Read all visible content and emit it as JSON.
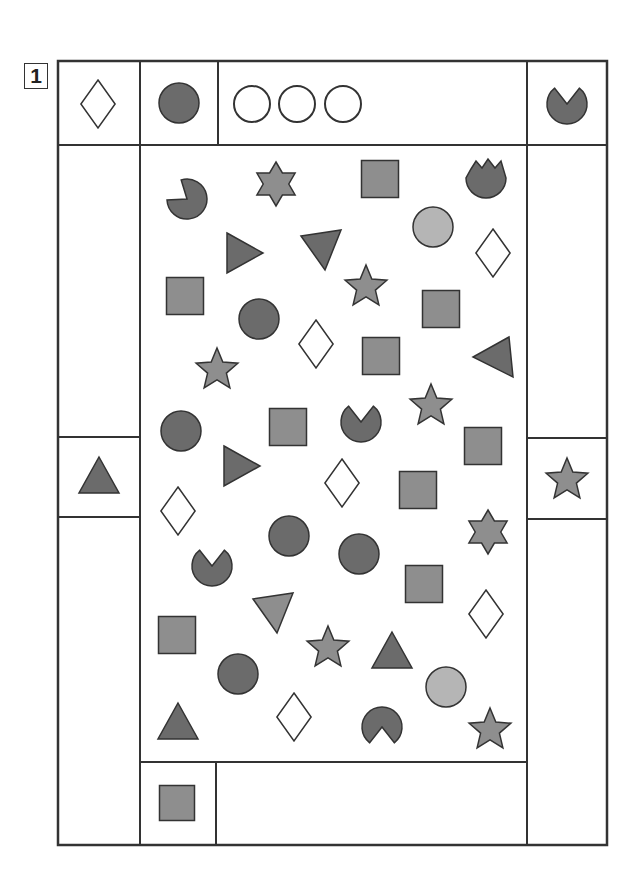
{
  "puzzle": {
    "number": "1",
    "colors": {
      "dark": "#6b6b6b",
      "medium": "#8e8e8e",
      "light": "#b5b5b5",
      "stroke": "#333333",
      "white": "#ffffff"
    },
    "frame": {
      "outer": {
        "x": 58,
        "y": 61,
        "w": 549,
        "h": 784
      },
      "lines": [
        {
          "x1": 58,
          "y1": 145,
          "x2": 607,
          "y2": 145
        },
        {
          "x1": 140,
          "y1": 61,
          "x2": 140,
          "y2": 845
        },
        {
          "x1": 527,
          "y1": 61,
          "x2": 527,
          "y2": 845
        },
        {
          "x1": 218,
          "y1": 61,
          "x2": 218,
          "y2": 145
        },
        {
          "x1": 140,
          "y1": 762,
          "x2": 527,
          "y2": 762
        },
        {
          "x1": 216,
          "y1": 762,
          "x2": 216,
          "y2": 845
        },
        {
          "x1": 58,
          "y1": 437,
          "x2": 140,
          "y2": 437
        },
        {
          "x1": 58,
          "y1": 517,
          "x2": 140,
          "y2": 517
        },
        {
          "x1": 527,
          "y1": 438,
          "x2": 607,
          "y2": 438
        },
        {
          "x1": 527,
          "y1": 519,
          "x2": 607,
          "y2": 519
        }
      ]
    },
    "clue_cells": [
      {
        "id": "top-left",
        "shape": "diamond",
        "fill": "white",
        "x": 98,
        "y": 104,
        "size": 36
      },
      {
        "id": "top-second",
        "shape": "circle",
        "fill": "dark",
        "x": 179,
        "y": 103,
        "size": 40
      },
      {
        "id": "top-wide-1",
        "shape": "circle",
        "fill": "white",
        "x": 252,
        "y": 104,
        "size": 36
      },
      {
        "id": "top-wide-2",
        "shape": "circle",
        "fill": "white",
        "x": 297,
        "y": 104,
        "size": 36
      },
      {
        "id": "top-wide-3",
        "shape": "circle",
        "fill": "white",
        "x": 343,
        "y": 104,
        "size": 36
      },
      {
        "id": "top-right",
        "shape": "pacman-up",
        "fill": "dark",
        "x": 567,
        "y": 104,
        "size": 40
      },
      {
        "id": "left-middle",
        "shape": "triangle-up",
        "fill": "dark",
        "x": 99,
        "y": 477,
        "size": 40
      },
      {
        "id": "right-middle",
        "shape": "star5",
        "fill": "medium",
        "x": 567,
        "y": 480,
        "size": 44
      },
      {
        "id": "bottom-left",
        "shape": "square",
        "fill": "medium",
        "x": 177,
        "y": 803,
        "size": 35
      }
    ],
    "field_shapes": [
      {
        "shape": "pacman-ul",
        "fill": "dark",
        "x": 187,
        "y": 199,
        "size": 40
      },
      {
        "shape": "star6",
        "fill": "medium",
        "x": 276,
        "y": 184,
        "size": 44
      },
      {
        "shape": "square",
        "fill": "medium",
        "x": 380,
        "y": 179,
        "size": 37
      },
      {
        "shape": "tulip",
        "fill": "dark",
        "x": 486,
        "y": 180,
        "size": 40
      },
      {
        "shape": "circle",
        "fill": "light",
        "x": 433,
        "y": 227,
        "size": 40
      },
      {
        "shape": "triangle-right",
        "fill": "dark",
        "x": 243,
        "y": 253,
        "size": 40
      },
      {
        "shape": "triangle-down",
        "fill": "dark",
        "x": 321,
        "y": 250,
        "size": 40
      },
      {
        "shape": "diamond",
        "fill": "white",
        "x": 493,
        "y": 253,
        "size": 36
      },
      {
        "shape": "star5",
        "fill": "medium",
        "x": 366,
        "y": 287,
        "size": 44
      },
      {
        "shape": "square",
        "fill": "medium",
        "x": 185,
        "y": 296,
        "size": 37
      },
      {
        "shape": "circle",
        "fill": "dark",
        "x": 259,
        "y": 319,
        "size": 40
      },
      {
        "shape": "square",
        "fill": "medium",
        "x": 441,
        "y": 309,
        "size": 37
      },
      {
        "shape": "diamond",
        "fill": "white",
        "x": 316,
        "y": 344,
        "size": 36
      },
      {
        "shape": "square",
        "fill": "medium",
        "x": 381,
        "y": 356,
        "size": 37
      },
      {
        "shape": "triangle-left",
        "fill": "dark",
        "x": 493,
        "y": 357,
        "size": 40
      },
      {
        "shape": "star5",
        "fill": "medium",
        "x": 217,
        "y": 370,
        "size": 44
      },
      {
        "shape": "circle",
        "fill": "dark",
        "x": 181,
        "y": 431,
        "size": 40
      },
      {
        "shape": "square",
        "fill": "medium",
        "x": 288,
        "y": 427,
        "size": 37
      },
      {
        "shape": "pacman-up",
        "fill": "dark",
        "x": 361,
        "y": 422,
        "size": 40
      },
      {
        "shape": "star5",
        "fill": "medium",
        "x": 431,
        "y": 406,
        "size": 44
      },
      {
        "shape": "square",
        "fill": "medium",
        "x": 483,
        "y": 446,
        "size": 37
      },
      {
        "shape": "triangle-right",
        "fill": "dark",
        "x": 240,
        "y": 466,
        "size": 40
      },
      {
        "shape": "diamond",
        "fill": "white",
        "x": 342,
        "y": 483,
        "size": 36
      },
      {
        "shape": "square",
        "fill": "medium",
        "x": 418,
        "y": 490,
        "size": 37
      },
      {
        "shape": "diamond",
        "fill": "white",
        "x": 178,
        "y": 511,
        "size": 36
      },
      {
        "shape": "star6",
        "fill": "medium",
        "x": 488,
        "y": 532,
        "size": 44
      },
      {
        "shape": "circle",
        "fill": "dark",
        "x": 289,
        "y": 536,
        "size": 40
      },
      {
        "shape": "circle",
        "fill": "dark",
        "x": 359,
        "y": 554,
        "size": 40
      },
      {
        "shape": "pacman-up",
        "fill": "dark",
        "x": 212,
        "y": 566,
        "size": 40
      },
      {
        "shape": "square",
        "fill": "medium",
        "x": 424,
        "y": 584,
        "size": 37
      },
      {
        "shape": "diamond",
        "fill": "white",
        "x": 486,
        "y": 614,
        "size": 36
      },
      {
        "shape": "triangle-down",
        "fill": "medium",
        "x": 273,
        "y": 613,
        "size": 40
      },
      {
        "shape": "square",
        "fill": "medium",
        "x": 177,
        "y": 635,
        "size": 37
      },
      {
        "shape": "star5",
        "fill": "medium",
        "x": 328,
        "y": 648,
        "size": 44
      },
      {
        "shape": "triangle-up",
        "fill": "dark",
        "x": 392,
        "y": 652,
        "size": 40
      },
      {
        "shape": "circle",
        "fill": "dark",
        "x": 238,
        "y": 674,
        "size": 40
      },
      {
        "shape": "circle",
        "fill": "light",
        "x": 446,
        "y": 687,
        "size": 40
      },
      {
        "shape": "triangle-up",
        "fill": "dark",
        "x": 178,
        "y": 723,
        "size": 40
      },
      {
        "shape": "diamond",
        "fill": "white",
        "x": 294,
        "y": 717,
        "size": 36
      },
      {
        "shape": "pacman-down",
        "fill": "dark",
        "x": 382,
        "y": 727,
        "size": 40
      },
      {
        "shape": "star5",
        "fill": "medium",
        "x": 490,
        "y": 730,
        "size": 44
      }
    ]
  }
}
